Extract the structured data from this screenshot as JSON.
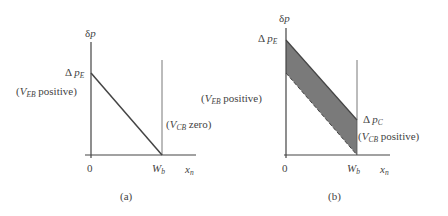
{
  "panels": [
    {
      "id": "a",
      "caption": "(a)",
      "y_axis_label": "δp",
      "x_axis_label": "x_n",
      "x_ticks": [
        "0",
        "W_b"
      ],
      "labels": {
        "dp_e": "Δp_E",
        "left_note": "(V_EB positive)",
        "right_note": "(V_CB zero)"
      }
    },
    {
      "id": "b",
      "caption": "(b)",
      "y_axis_label": "δp",
      "x_axis_label": "x_n",
      "x_ticks": [
        "0",
        "W_b"
      ],
      "labels": {
        "dp_e": "Δp_E",
        "left_note": "(V_EB positive)",
        "dp_c": "Δp_C",
        "right_note": "(V_CB positive)"
      }
    }
  ],
  "text": {
    "delta": "δ",
    "p": "p",
    "Delta": "Δ",
    "E": "E",
    "C": "C",
    "EB": "EB",
    "CB": "CB",
    "V": "V",
    "positive": " positive)",
    "zero": " zero)",
    "open": "(",
    "zero_tick": "0",
    "W": "W",
    "b": "b",
    "x": "x",
    "n": "n",
    "cap_a": "(a)",
    "cap_b": "(b)"
  },
  "colors": {
    "line": "#444444",
    "band_fill": "#7a7a7a",
    "text": "#444444"
  }
}
